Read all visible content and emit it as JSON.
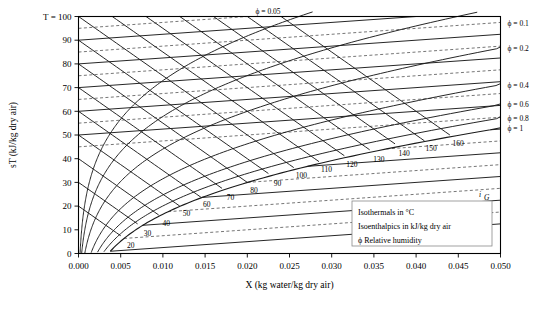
{
  "chart_data": {
    "type": "line",
    "title": "",
    "xlabel": "X (kg water/kg dry air)",
    "ylabel": "sT (kJ/kg dry air)",
    "y_axis_corner_label": "T = 100",
    "xlim": [
      0.0,
      0.05
    ],
    "ylim": [
      0,
      100
    ],
    "grid": false,
    "x_ticks": [
      0.0,
      0.005,
      0.01,
      0.015,
      0.02,
      0.025,
      0.03,
      0.035,
      0.04,
      0.045,
      0.05
    ],
    "x_tick_labels": [
      "0.000",
      "0.005",
      "0.010",
      "0.015",
      "0.020",
      "0.025",
      "0.030",
      "0.035",
      "0.040",
      "0.045",
      "0.050"
    ],
    "y_ticks": [
      0,
      10,
      20,
      30,
      40,
      50,
      60,
      70,
      80,
      90,
      100
    ],
    "y_tick_labels": [
      "0",
      "10",
      "20",
      "30",
      "40",
      "50",
      "60",
      "70",
      "80",
      "90",
      "100"
    ],
    "isotherms": {
      "name": "Isotherms",
      "unit": "°C",
      "major_values": [
        0,
        10,
        20,
        30,
        40,
        50,
        60,
        70,
        80,
        90,
        100
      ],
      "minor_values": [
        5,
        15,
        25,
        35,
        45,
        55,
        65,
        75,
        85,
        95
      ],
      "style_major": "solid",
      "style_minor": "dashed"
    },
    "isenthalpics": {
      "name": "Isenthalpics",
      "unit": "kJ/kg dry air",
      "values": [
        20,
        30,
        40,
        50,
        60,
        70,
        80,
        90,
        100,
        110,
        120,
        130,
        140,
        150,
        160
      ],
      "labels": [
        "20",
        "30",
        "40",
        "50",
        "60",
        "70",
        "80",
        "90",
        "100",
        "110",
        "120",
        "130",
        "140",
        "150",
        "160"
      ],
      "axis_symbol": "i",
      "axis_symbol_sub": "G",
      "style": "solid"
    },
    "relative_humidity": {
      "name": "Relative humidity",
      "symbol": "ϕ",
      "values": [
        0.05,
        0.1,
        0.2,
        0.4,
        0.6,
        0.8,
        1.0
      ],
      "top_label": "ϕ = 0.05",
      "right_labels": [
        "ϕ = 0.1",
        "ϕ = 0.2",
        "ϕ = 0.4",
        "ϕ = 0.6",
        "ϕ = 0.8",
        "ϕ = 1"
      ],
      "right_label_values": [
        0.1,
        0.2,
        0.4,
        0.6,
        0.8,
        1.0
      ],
      "style": "solid"
    },
    "legend": {
      "position": "bottom-right-inside",
      "entries": [
        "Isothermals in °C",
        "Isoenthalpics in kJ/kg dry air",
        "ϕ Relative humidity"
      ]
    },
    "colors": {
      "line": "#1a1a1a",
      "axis": "#000000",
      "background": "#ffffff",
      "legend_border": "#888888"
    }
  }
}
